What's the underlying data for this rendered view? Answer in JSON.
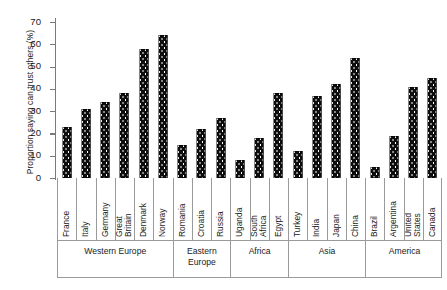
{
  "chart_data": {
    "type": "bar",
    "title": "",
    "xlabel": "",
    "ylabel": "Proportion saying can trust others (%)",
    "ylim": [
      0,
      70
    ],
    "yticks": [
      0,
      10,
      20,
      30,
      40,
      50,
      60,
      70
    ],
    "ytick_labels": [
      "0",
      "10",
      "20",
      "30",
      "40",
      "50",
      "60",
      "70"
    ],
    "grid": false,
    "legend": "none",
    "bar_color": "#0d0d0d",
    "bar_pattern": "white-dot-stipple",
    "categories": [
      "France",
      "Italy",
      "Germany",
      "Great Britain",
      "Denmark",
      "Norway",
      "Romania",
      "Croatia",
      "Russia",
      "Uganda",
      "South Africa",
      "Egypt",
      "Turkey",
      "India",
      "Japan",
      "China",
      "Brazil",
      "Argentina",
      "United States",
      "Canada"
    ],
    "values": [
      23,
      31,
      34,
      38,
      58,
      64,
      15,
      22,
      27,
      8,
      18,
      38,
      12,
      37,
      42,
      54,
      5,
      19,
      41,
      45
    ],
    "groups": [
      {
        "label": "Western Europe",
        "count": 6
      },
      {
        "label": "Eastern\nEurope",
        "count": 3
      },
      {
        "label": "Africa",
        "count": 3
      },
      {
        "label": "Asia",
        "count": 4
      },
      {
        "label": "America",
        "count": 4
      }
    ],
    "bars": [
      {
        "category": "France",
        "label": "France",
        "value": 23,
        "group": "Western Europe"
      },
      {
        "category": "Italy",
        "label": "Italy",
        "value": 31,
        "group": "Western Europe"
      },
      {
        "category": "Germany",
        "label": "Germany",
        "value": 34,
        "group": "Western Europe"
      },
      {
        "category": "Great Britain",
        "label": "Great\nBritain",
        "value": 38,
        "group": "Western Europe"
      },
      {
        "category": "Denmark",
        "label": "Denmark",
        "value": 58,
        "group": "Western Europe"
      },
      {
        "category": "Norway",
        "label": "Norway",
        "value": 64,
        "group": "Western Europe"
      },
      {
        "category": "Romania",
        "label": "Romania",
        "value": 15,
        "group": "Eastern Europe"
      },
      {
        "category": "Croatia",
        "label": "Croatia",
        "value": 22,
        "group": "Eastern Europe"
      },
      {
        "category": "Russia",
        "label": "Russia",
        "value": 27,
        "group": "Eastern Europe"
      },
      {
        "category": "Uganda",
        "label": "Uganda",
        "value": 8,
        "group": "Africa"
      },
      {
        "category": "South Africa",
        "label": "South\nAfrica",
        "value": 18,
        "group": "Africa"
      },
      {
        "category": "Egypt",
        "label": "Egypt",
        "value": 38,
        "group": "Africa"
      },
      {
        "category": "Turkey",
        "label": "Turkey",
        "value": 12,
        "group": "Asia"
      },
      {
        "category": "India",
        "label": "India",
        "value": 37,
        "group": "Asia"
      },
      {
        "category": "Japan",
        "label": "Japan",
        "value": 42,
        "group": "Asia"
      },
      {
        "category": "China",
        "label": "China",
        "value": 54,
        "group": "Asia"
      },
      {
        "category": "Brazil",
        "label": "Brazil",
        "value": 5,
        "group": "America"
      },
      {
        "category": "Argentina",
        "label": "Argentina",
        "value": 19,
        "group": "America"
      },
      {
        "category": "United States",
        "label": "United\nStates",
        "value": 41,
        "group": "America"
      },
      {
        "category": "Canada",
        "label": "Canada",
        "value": 45,
        "group": "America"
      }
    ]
  }
}
